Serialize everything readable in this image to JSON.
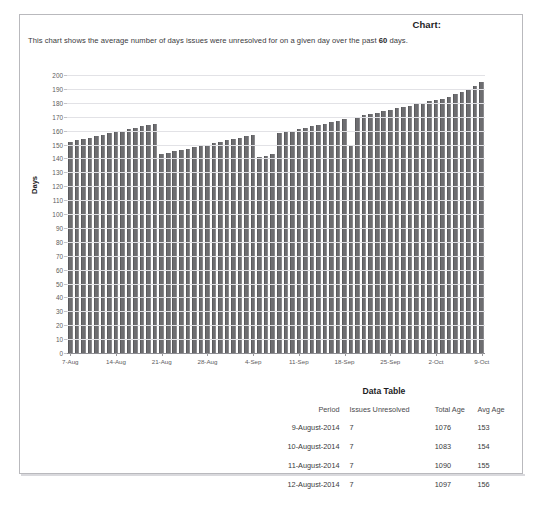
{
  "panel": {
    "title": "Chart:",
    "intro_before": "This chart shows the average number of days issues were unresolved for on a given day over the past ",
    "intro_bold": "60",
    "intro_after": " days."
  },
  "chart_data": {
    "type": "bar",
    "title": "Chart:",
    "xlabel": "",
    "ylabel": "Days",
    "ylim": [
      0,
      200
    ],
    "ytick_step": 10,
    "grid": true,
    "legend": false,
    "bar_color": "#6d6d70",
    "yticks": [
      0,
      10,
      20,
      30,
      40,
      50,
      60,
      70,
      80,
      90,
      100,
      110,
      120,
      130,
      140,
      150,
      160,
      170,
      180,
      190,
      200
    ],
    "xtick_labels": [
      "7-Aug",
      "14-Aug",
      "21-Aug",
      "28-Aug",
      "4-Sep",
      "11-Sep",
      "18-Sep",
      "25-Sep",
      "2-Oct",
      "9-Oct"
    ],
    "xtick_positions": [
      0,
      7,
      14,
      21,
      28,
      35,
      42,
      49,
      56,
      63
    ],
    "x": [
      "7-Aug",
      "8-Aug",
      "9-Aug",
      "10-Aug",
      "11-Aug",
      "12-Aug",
      "13-Aug",
      "14-Aug",
      "15-Aug",
      "16-Aug",
      "17-Aug",
      "18-Aug",
      "19-Aug",
      "20-Aug",
      "21-Aug",
      "22-Aug",
      "23-Aug",
      "24-Aug",
      "25-Aug",
      "26-Aug",
      "27-Aug",
      "28-Aug",
      "29-Aug",
      "30-Aug",
      "31-Aug",
      "1-Sep",
      "2-Sep",
      "3-Sep",
      "4-Sep",
      "5-Sep",
      "6-Sep",
      "7-Sep",
      "8-Sep",
      "9-Sep",
      "10-Sep",
      "11-Sep",
      "12-Sep",
      "13-Sep",
      "14-Sep",
      "15-Sep",
      "16-Sep",
      "17-Sep",
      "18-Sep",
      "19-Sep",
      "20-Sep",
      "21-Sep",
      "22-Sep",
      "23-Sep",
      "24-Sep",
      "25-Sep",
      "26-Sep",
      "27-Sep",
      "28-Sep",
      "29-Sep",
      "30-Sep",
      "1-Oct",
      "2-Oct",
      "3-Oct",
      "4-Oct",
      "5-Oct",
      "6-Oct",
      "7-Oct",
      "8-Oct",
      "9-Oct"
    ],
    "values": [
      152,
      153,
      154,
      155,
      156,
      157,
      158,
      159,
      160,
      161,
      162,
      163,
      164,
      165,
      143,
      144,
      145,
      146,
      147,
      148,
      149,
      150,
      151,
      152,
      153,
      154,
      155,
      156,
      157,
      141,
      142,
      143,
      158,
      159,
      160,
      161,
      162,
      163,
      164,
      165,
      166,
      167,
      168,
      150,
      170,
      171,
      172,
      173,
      174,
      175,
      176,
      177,
      178,
      179,
      180,
      181,
      182,
      183,
      184,
      186,
      188,
      190,
      192,
      195
    ]
  },
  "data_table": {
    "title": "Data Table",
    "columns": [
      "Period",
      "Issues Unresolved",
      "Total Age",
      "Avg Age"
    ],
    "rows": [
      {
        "period": "9-August-2014",
        "unresolved": "7",
        "total_age": "1076",
        "avg_age": "153"
      },
      {
        "period": "10-August-2014",
        "unresolved": "7",
        "total_age": "1083",
        "avg_age": "154"
      },
      {
        "period": "11-August-2014",
        "unresolved": "7",
        "total_age": "1090",
        "avg_age": "155"
      },
      {
        "period": "12-August-2014",
        "unresolved": "7",
        "total_age": "1097",
        "avg_age": "156"
      }
    ]
  }
}
